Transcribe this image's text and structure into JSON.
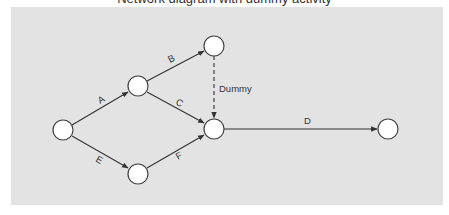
{
  "caption": {
    "text": "Network diagram with dummy activity",
    "note": "partially cropped at top edge"
  },
  "colors": {
    "panel_bg": "#e3e3e3",
    "node_fill": "#ffffff",
    "node_stroke": "#444444",
    "edge": "#333333"
  },
  "diagram": {
    "type": "activity-on-arrow network",
    "nodes": [
      {
        "id": "n1",
        "cx": 63,
        "cy": 130
      },
      {
        "id": "n2",
        "cx": 138,
        "cy": 86
      },
      {
        "id": "n3",
        "cx": 214,
        "cy": 46
      },
      {
        "id": "n4",
        "cx": 214,
        "cy": 129
      },
      {
        "id": "n5",
        "cx": 138,
        "cy": 174
      },
      {
        "id": "n6",
        "cx": 388,
        "cy": 129
      }
    ],
    "edges": [
      {
        "id": "A",
        "label": "A",
        "from": "n1",
        "to": "n2",
        "style": "solid"
      },
      {
        "id": "B",
        "label": "B",
        "from": "n2",
        "to": "n3",
        "style": "solid"
      },
      {
        "id": "C",
        "label": "C",
        "from": "n2",
        "to": "n4",
        "style": "solid"
      },
      {
        "id": "Dummy",
        "label": "Dummy",
        "from": "n3",
        "to": "n4",
        "style": "dashed"
      },
      {
        "id": "D",
        "label": "D",
        "from": "n4",
        "to": "n6",
        "style": "solid"
      },
      {
        "id": "E",
        "label": "E",
        "from": "n1",
        "to": "n5",
        "style": "solid"
      },
      {
        "id": "F",
        "label": "F",
        "from": "n5",
        "to": "n4",
        "style": "solid"
      }
    ],
    "labels": {
      "A": "A",
      "B": "B",
      "C": "C",
      "D": "D",
      "E": "E",
      "F": "F",
      "dummy": "Dummy"
    }
  }
}
